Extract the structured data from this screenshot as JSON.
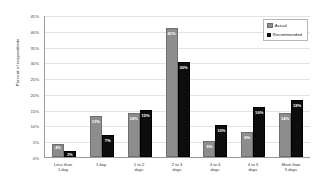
{
  "chart_data": {
    "type": "bar",
    "title": "",
    "xlabel": "",
    "ylabel": "Percent of respondents",
    "ylim": [
      0,
      45
    ],
    "ytick_labels": [
      "45%",
      "40%",
      "35%",
      "30%",
      "25%",
      "20%",
      "15%",
      "10%",
      "5%",
      "0%"
    ],
    "ytick_values": [
      45,
      40,
      35,
      30,
      25,
      20,
      15,
      10,
      5,
      0
    ],
    "grid": true,
    "legend_position": "top-right",
    "categories": [
      "Less than\n1 day",
      "1 day",
      "1 to 2\ndays",
      "2 to 3\ndays",
      "3 to 4\ndays",
      "4 to 5\ndays",
      "More than\n5 days"
    ],
    "series": [
      {
        "name": "Actual",
        "color": "#8d8d8d",
        "values": [
          4,
          13,
          14,
          41,
          5,
          8,
          14
        ],
        "labels": [
          "4%",
          "13%",
          "14%",
          "41%",
          "5%",
          "8%",
          "14%"
        ]
      },
      {
        "name": "Recommended",
        "color": "#0d0d0d",
        "values": [
          2,
          7,
          15,
          30,
          10,
          16,
          18
        ],
        "labels": [
          "2%",
          "7%",
          "15%",
          "30%",
          "10%",
          "16%",
          "18%"
        ]
      }
    ]
  }
}
